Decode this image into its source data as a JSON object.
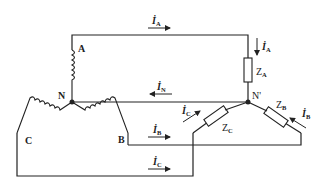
{
  "diagram": {
    "type": "three-phase Y-Y circuit with neutral wire",
    "nodes": [
      {
        "id": "N",
        "label": "N"
      },
      {
        "id": "N_prime",
        "label": "N'"
      },
      {
        "id": "A",
        "label": "A"
      },
      {
        "id": "B",
        "label": "B"
      },
      {
        "id": "C",
        "label": "C"
      }
    ],
    "impedances": [
      {
        "id": "ZA",
        "symbol": "Z",
        "sub": "A"
      },
      {
        "id": "ZB",
        "symbol": "Z",
        "sub": "B"
      },
      {
        "id": "ZC",
        "symbol": "Z",
        "sub": "C"
      }
    ],
    "currents": {
      "IA_line": {
        "symbol": "İ",
        "sub": "A",
        "direction": "right"
      },
      "IA_load": {
        "symbol": "İ",
        "sub": "A",
        "direction": "down"
      },
      "IN": {
        "symbol": "İ",
        "sub": "N",
        "direction": "left"
      },
      "IB_line": {
        "symbol": "İ",
        "sub": "B",
        "direction": "right"
      },
      "IB_load": {
        "symbol": "İ",
        "sub": "B",
        "direction": "up-left"
      },
      "IC_line": {
        "symbol": "İ",
        "sub": "C",
        "direction": "right"
      },
      "IC_load": {
        "symbol": "İ",
        "sub": "C",
        "direction": "up-right"
      }
    },
    "colors": {
      "stroke": "#222222",
      "background": "#ffffff"
    }
  }
}
